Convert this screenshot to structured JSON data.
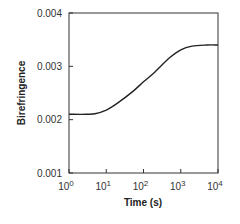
{
  "chart_data": {
    "type": "line",
    "title": "",
    "xlabel": "Time (s)",
    "ylabel": "Birefringence",
    "xscale": "log",
    "xlim": [
      1,
      10000
    ],
    "ylim": [
      0.001,
      0.004
    ],
    "grid": false,
    "legend": null,
    "x_ticks": [
      {
        "base": "10",
        "exp": "0",
        "value": 1
      },
      {
        "base": "10",
        "exp": "1",
        "value": 10
      },
      {
        "base": "10",
        "exp": "2",
        "value": 100
      },
      {
        "base": "10",
        "exp": "3",
        "value": 1000
      },
      {
        "base": "10",
        "exp": "4",
        "value": 10000
      }
    ],
    "y_ticks": [
      "0.001",
      "0.002",
      "0.003",
      "0.004"
    ],
    "series": [
      {
        "name": "Birefringence",
        "color": "#222222",
        "x": [
          1,
          3,
          5,
          10,
          20,
          50,
          100,
          200,
          500,
          1000,
          2000,
          5000,
          10000
        ],
        "y": [
          0.0021,
          0.0021,
          0.00211,
          0.00218,
          0.00231,
          0.00252,
          0.00271,
          0.00289,
          0.00316,
          0.00331,
          0.00338,
          0.0034,
          0.0034
        ]
      }
    ]
  }
}
